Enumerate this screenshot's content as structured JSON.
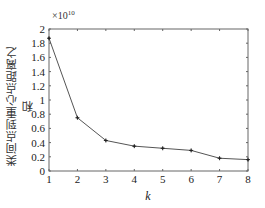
{
  "chart_data": {
    "type": "line",
    "title": "",
    "xlabel": "k",
    "ylabel": "类间点到重心点距离之和",
    "y_multiplier": "×10",
    "y_multiplier_exp": "10",
    "x": [
      1,
      2,
      3,
      4,
      5,
      6,
      7,
      8
    ],
    "series": [
      {
        "name": "sum",
        "values": [
          1.87,
          0.75,
          0.43,
          0.35,
          0.32,
          0.29,
          0.18,
          0.16
        ]
      }
    ],
    "xlim": [
      1,
      8
    ],
    "ylim": [
      0,
      2
    ],
    "x_ticks": [
      "1",
      "2",
      "3",
      "4",
      "5",
      "6",
      "7",
      "8"
    ],
    "y_ticks": [
      "0",
      "0.2",
      "0.4",
      "0.6",
      "0.8",
      "1",
      "1.2",
      "1.4",
      "1.6",
      "1.8",
      "2"
    ],
    "grid": false,
    "legend": null,
    "line_color": "#555555",
    "marker": "*"
  }
}
